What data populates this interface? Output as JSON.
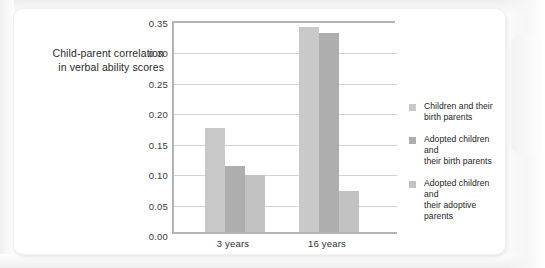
{
  "chart_data": {
    "type": "bar",
    "title": "",
    "xlabel": "",
    "ylabel": "Child-parent correlation in verbal ability scores",
    "ylabel_lines": [
      "Child-parent correlation",
      "in verbal ability scores"
    ],
    "categories": [
      "3 years",
      "16 years"
    ],
    "series": [
      {
        "name": "Children and their birth parents",
        "name_lines": [
          "Children and their",
          "birth parents"
        ],
        "color": "#c9c9c9",
        "values": [
          0.175,
          0.34
        ]
      },
      {
        "name": "Adopted children and their birth parents",
        "name_lines": [
          "Adopted children and",
          "their birth parents"
        ],
        "color": "#aeaeae",
        "values": [
          0.112,
          0.33
        ]
      },
      {
        "name": "Adopted children and their adoptive parents",
        "name_lines": [
          "Adopted children and",
          "their adoptive parents"
        ],
        "color": "#c2c2c2",
        "values": [
          0.097,
          0.07
        ]
      }
    ],
    "ylim": [
      0.0,
      0.35
    ],
    "ytick_values": [
      0.0,
      0.05,
      0.1,
      0.15,
      0.2,
      0.25,
      0.3,
      0.35
    ],
    "ytick_labels": [
      "0.00",
      "0.05",
      "0.10",
      "0.15",
      "0.20",
      "0.25",
      "0.30",
      "0.35"
    ],
    "grid": true,
    "grid_axis": "y",
    "legend_position": "right",
    "axis_color": "#b4b4b4",
    "grid_color": "#d2d2d2"
  },
  "legend": {
    "items": [
      {
        "label_line1": "Children and their",
        "label_line2": "birth parents"
      },
      {
        "label_line1": "Adopted children and",
        "label_line2": "their birth parents"
      },
      {
        "label_line1": "Adopted children and",
        "label_line2": "their adoptive parents"
      }
    ]
  },
  "axis": {
    "y_title_line1": "Child-parent correlation",
    "y_title_line2": "in verbal ability scores",
    "x_labels": [
      "3 years",
      "16 years"
    ],
    "y_labels": [
      "0.35",
      "0.30",
      "0.25",
      "0.20",
      "0.15",
      "0.10",
      "0.05",
      "0.00"
    ]
  }
}
